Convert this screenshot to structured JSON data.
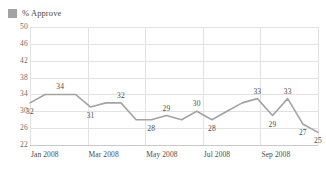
{
  "legend": {
    "entries": [
      {
        "label": "% Approve",
        "color": "#a3a3a3",
        "icon": "square-swatch-icon"
      }
    ],
    "position": "top-left"
  },
  "chart_data": {
    "type": "line",
    "title": "",
    "xlabel": "",
    "ylabel": "",
    "ylim": [
      22,
      50
    ],
    "yticks": [
      50,
      46,
      42,
      38,
      34,
      30,
      26,
      22
    ],
    "xticks": [
      "Jan 2008",
      "Mar 2008",
      "May 2008",
      "Jul 2008",
      "Sep 2008"
    ],
    "grid": true,
    "series": [
      {
        "name": "% Approve",
        "color": "#a3a3a3",
        "values": [
          32,
          34,
          34,
          34,
          31,
          32,
          32,
          28,
          28,
          29,
          28,
          30,
          28,
          30,
          32,
          33,
          29,
          33,
          27,
          25
        ]
      }
    ],
    "labeled_points": [
      {
        "value": 32,
        "label": "32"
      },
      {
        "value": 34,
        "label": "34"
      },
      {
        "value": 31,
        "label": "31"
      },
      {
        "value": 32,
        "label": "32"
      },
      {
        "value": 28,
        "label": "28"
      },
      {
        "value": 29,
        "label": "29"
      },
      {
        "value": 30,
        "label": "30"
      },
      {
        "value": 28,
        "label": "28"
      },
      {
        "value": 33,
        "label": "33"
      },
      {
        "value": 29,
        "label": "29"
      },
      {
        "value": 33,
        "label": "33"
      },
      {
        "value": 27,
        "label": "27"
      },
      {
        "value": 25,
        "label": "25"
      }
    ]
  },
  "axis": {
    "y": [
      {
        "label": "50"
      },
      {
        "label": "46"
      },
      {
        "label": "42"
      },
      {
        "label": "38"
      },
      {
        "label": "34"
      },
      {
        "label": "30"
      },
      {
        "label": "26"
      },
      {
        "label": "22"
      }
    ],
    "x": [
      {
        "label": "Jan 2008"
      },
      {
        "label": "Mar 2008"
      },
      {
        "label": "May 2008"
      },
      {
        "label": "Jul 2008"
      },
      {
        "label": "Sep 2008"
      }
    ]
  }
}
